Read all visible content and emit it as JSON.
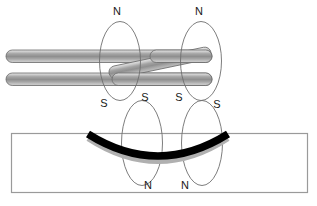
{
  "labels": {
    "upper_ellipses": [
      {
        "id": "upper-left",
        "top": "N",
        "bottom": "S"
      },
      {
        "id": "upper-right",
        "top": "N",
        "bottom": "S"
      }
    ],
    "lower_ellipses": [
      {
        "id": "lower-left",
        "top": "S",
        "bottom": "N"
      },
      {
        "id": "lower-right",
        "top": "S",
        "bottom": "N"
      }
    ],
    "north_top_left": "N",
    "north_top_right": "N",
    "south_upper_left": "S",
    "south_upper_mid_left": "S",
    "south_upper_mid_right": "S",
    "south_upper_right": "S",
    "north_bottom_left": "N",
    "north_bottom_right": "N"
  },
  "colors": {
    "background": "#ffffff",
    "ellipse_stroke": "#6e6e6e",
    "rectangle_stroke": "#9a9a9a",
    "weld_pool": "#000000",
    "weld_pool_shadow": "#b0b0b0",
    "rod_light": "#d8d8d8",
    "rod_mid": "#9d9d9d",
    "rod_dark": "#7f7f7f",
    "label_text": "#1a1a1a"
  },
  "geometry": {
    "canvas_width": 317,
    "canvas_height": 206,
    "workpiece": {
      "x": 11,
      "y": 133,
      "width": 297,
      "height": 60
    },
    "upper_ellipses": [
      {
        "cx": 120,
        "cy": 61,
        "rx": 20,
        "ry": 39
      },
      {
        "cx": 201,
        "cy": 61,
        "rx": 20,
        "ry": 39
      }
    ],
    "lower_ellipses": [
      {
        "cx": 142,
        "cy": 143,
        "rx": 20,
        "ry": 42
      },
      {
        "cx": 202,
        "cy": 143,
        "rx": 20,
        "ry": 42
      }
    ],
    "rods": {
      "top_rod": {
        "x1": 11,
        "y1": 56,
        "x2": 212,
        "y2": 56,
        "thickness": 12
      },
      "bottom_rod": {
        "x1": 11,
        "y1": 79,
        "x2": 212,
        "y2": 79,
        "thickness": 12
      },
      "diagonal_rod": {
        "x1": 112,
        "y1": 79,
        "x2": 210,
        "y2": 57,
        "thickness": 12
      }
    },
    "weld_arc": {
      "start_x": 88,
      "start_y": 134,
      "end_x": 228,
      "end_y": 134,
      "depth": 38,
      "thickness": 7
    }
  }
}
